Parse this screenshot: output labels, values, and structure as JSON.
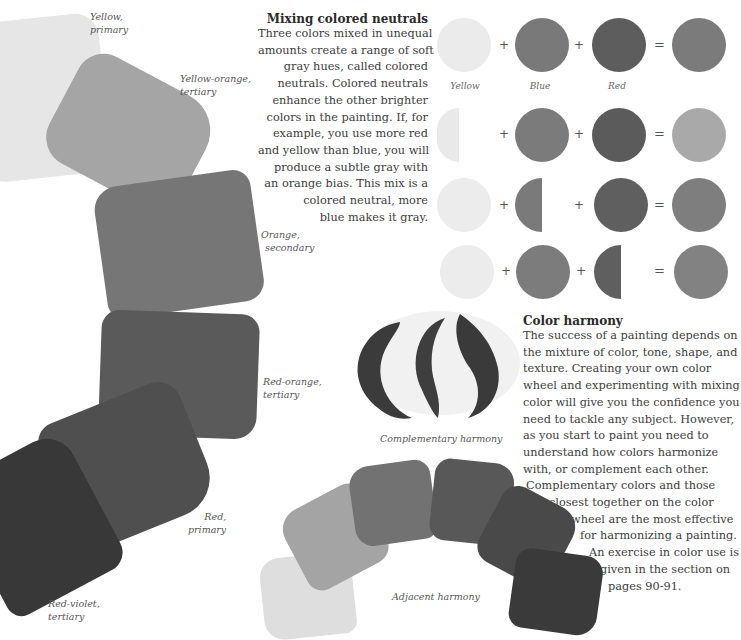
{
  "color_wheel": {
    "swatches": [
      {
        "name": "Yellow",
        "role": "primary",
        "label_line1": "Yellow,",
        "label_line2": "primary",
        "color": "#e6e6e6"
      },
      {
        "name": "Yellow-orange",
        "role": "tertiary",
        "label_line1": "Yellow-orange,",
        "label_line2": "tertiary",
        "color": "#a6a6a6"
      },
      {
        "name": "Orange",
        "role": "secondary",
        "label_line1": "Orange,",
        "label_line2": "secondary",
        "color": "#767676"
      },
      {
        "name": "Red-orange",
        "role": "tertiary",
        "label_line1": "Red-orange,",
        "label_line2": "tertiary",
        "color": "#5a5a5a"
      },
      {
        "name": "Red",
        "role": "primary",
        "label_line1": "Red,",
        "label_line2": "primary",
        "color": "#505050"
      },
      {
        "name": "Red-violet",
        "role": "tertiary",
        "label_line1": "Red-violet,",
        "label_line2": "tertiary",
        "color": "#3a3a3a"
      }
    ]
  },
  "mixing_section": {
    "heading": "Mixing colored neutrals",
    "lines": [
      "Three colors mixed in unequal",
      "amounts create a range of soft",
      "gray hues, called colored",
      "neutrals. Colored neutrals",
      "enhance the other brighter",
      "colors in the painting. If, for",
      "example, you use more red",
      "and yellow than blue, you will",
      "produce a subtle gray with",
      "an orange bias. This mix is a",
      "colored neutral, more",
      "blue makes it gray."
    ],
    "column_labels": [
      "Yellow",
      "Blue",
      "Red"
    ],
    "plus_symbol": "+",
    "equals_symbol": "=",
    "rows": [
      {
        "yellow": "full",
        "blue": "full",
        "red": "full",
        "result_color": "#7a7a7a"
      },
      {
        "yellow": "half",
        "blue": "full",
        "red": "full",
        "result_color": "#a8a8a8"
      },
      {
        "yellow": "full",
        "blue": "half",
        "red": "full",
        "result_color": "#7e7e7e"
      },
      {
        "yellow": "full",
        "blue": "full",
        "red": "half",
        "result_color": "#828282"
      }
    ],
    "colors": {
      "yellow": "#e8e8e8",
      "blue": "#7a7a7a",
      "red": "#5e5e5e"
    }
  },
  "complementary": {
    "caption": "Complementary harmony"
  },
  "harmony_section": {
    "heading": "Color harmony",
    "lines": [
      "The success of a painting depends on",
      "the mixture of color, tone, shape, and",
      "texture. Creating your own color",
      "wheel and experimenting with mixing",
      "color will give you the confidence you",
      "need to tackle any subject. However,",
      "as you start to paint you need to",
      "understand how colors harmonize",
      "with, or complement each other.",
      "Complementary colors and those",
      "closest together on the color",
      "wheel are the most effective",
      "for harmonizing a painting.",
      "An exercise in color use is",
      "given in the section on",
      "pages 90-91."
    ]
  },
  "adjacent": {
    "caption": "Adjacent harmony",
    "swatch_colors": [
      "#dedede",
      "#a4a4a4",
      "#727272",
      "#585858",
      "#494949",
      "#3a3a3a"
    ]
  }
}
